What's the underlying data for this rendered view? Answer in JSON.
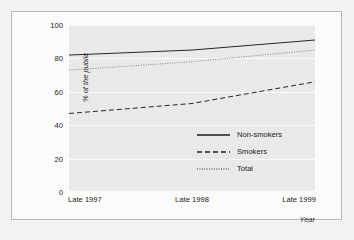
{
  "chart_data": {
    "type": "line",
    "title": "",
    "xlabel": "Year",
    "ylabel": "% of the public",
    "x": [
      "Late 1997",
      "Late 1998",
      "Late 1999"
    ],
    "xticklabels": [
      "Late 1997",
      "Late 1998",
      "Late 1999"
    ],
    "yticklabels": [
      "0",
      "20",
      "40",
      "60",
      "80",
      "100"
    ],
    "yticks": [
      0,
      20,
      40,
      60,
      80,
      100
    ],
    "ylim": [
      0,
      100
    ],
    "grid": true,
    "legend_position": "lower right",
    "series": [
      {
        "name": "Non-smokers",
        "style": "solid",
        "values": [
          82,
          85,
          91
        ]
      },
      {
        "name": "Smokers",
        "style": "dashed",
        "values": [
          47,
          53,
          66
        ]
      },
      {
        "name": "Total",
        "style": "dotted",
        "values": [
          73,
          78,
          85
        ]
      }
    ]
  },
  "legend": {
    "items": [
      {
        "label": "Non-smokers",
        "style": "solid"
      },
      {
        "label": "Smokers",
        "style": "dashed"
      },
      {
        "label": "Total",
        "style": "dotted"
      }
    ]
  },
  "colors": {
    "plot_background": "#e9e9e7",
    "figure_background": "#fbfbfa",
    "page_background": "#f3f2f0",
    "gridline": "#fafafa",
    "line": "#1c1c1c",
    "frame_border": "#b9b9b6"
  }
}
